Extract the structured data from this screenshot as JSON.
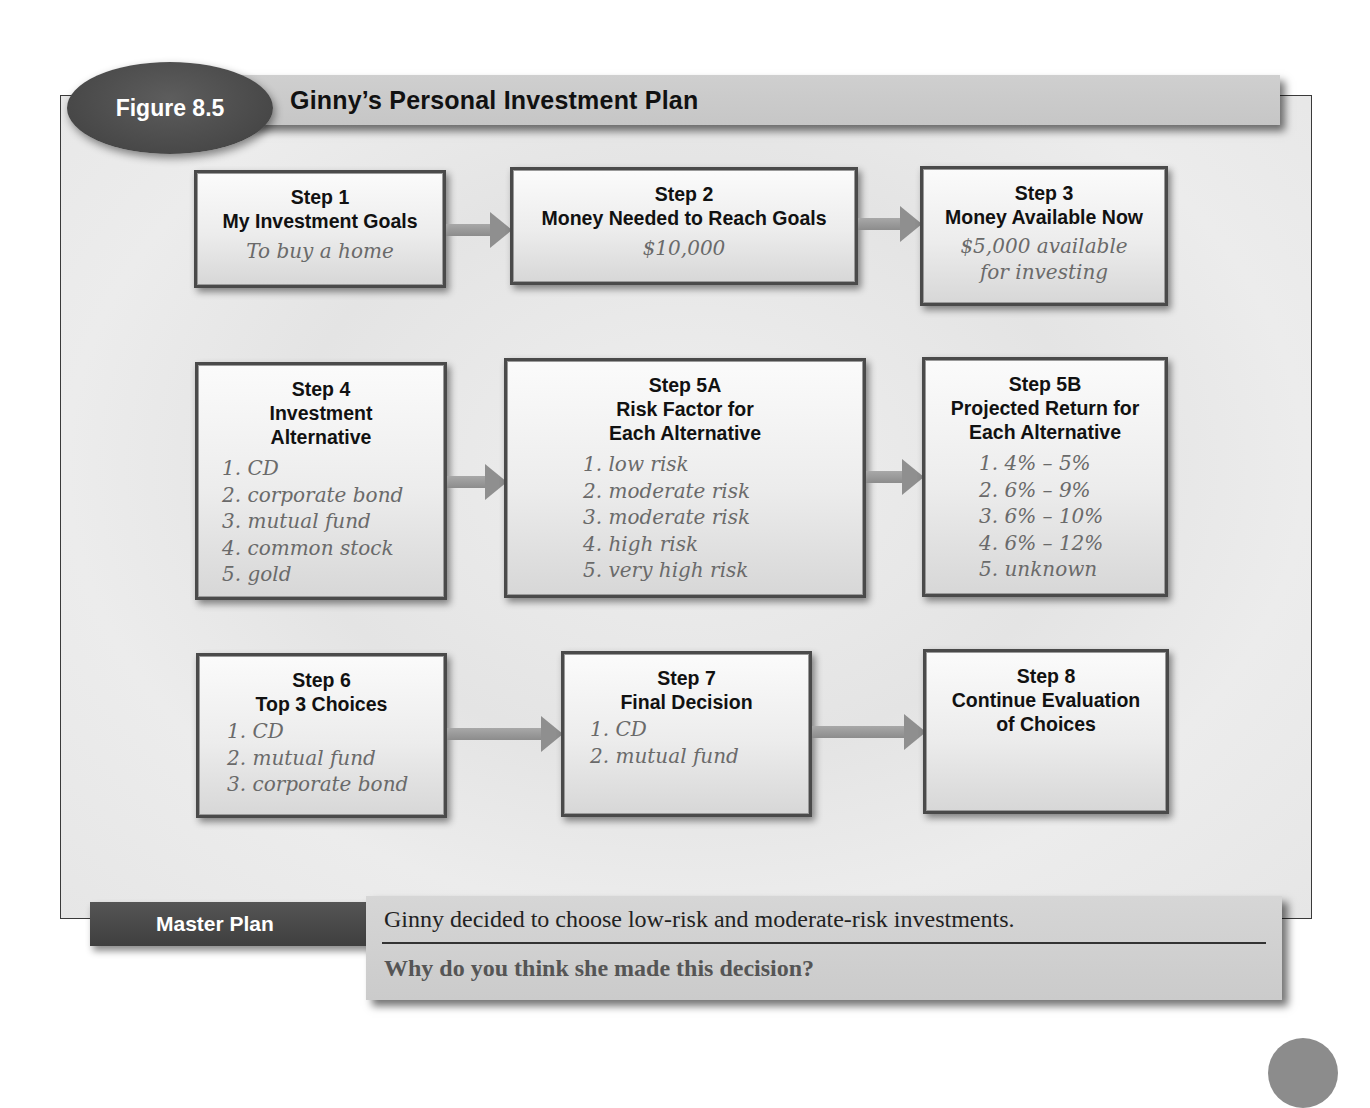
{
  "figure": {
    "label": "Figure 8.5",
    "title": "Ginny’s Personal Investment Plan"
  },
  "steps": {
    "s1": {
      "step": "Step 1",
      "heading": "My Investment Goals",
      "note": "To buy a home"
    },
    "s2": {
      "step": "Step 2",
      "heading": "Money Needed to Reach Goals",
      "note": "$10,000"
    },
    "s3": {
      "step": "Step 3",
      "heading": "Money Available Now",
      "note_line1": "$5,000 available",
      "note_line2": "for investing"
    },
    "s4": {
      "step": "Step 4",
      "heading_line1": "Investment",
      "heading_line2": "Alternative",
      "items": [
        "1. CD",
        "2. corporate bond",
        "3. mutual fund",
        "4. common stock",
        "5. gold"
      ]
    },
    "s5a": {
      "step": "Step 5A",
      "heading_line1": "Risk Factor for",
      "heading_line2": "Each Alternative",
      "items": [
        "1. low risk",
        "2. moderate risk",
        "3. moderate risk",
        "4. high risk",
        "5. very high risk"
      ]
    },
    "s5b": {
      "step": "Step 5B",
      "heading_line1": "Projected Return for",
      "heading_line2": "Each Alternative",
      "items": [
        "1. 4% – 5%",
        "2. 6% – 9%",
        "3. 6% – 10%",
        "4. 6% – 12%",
        "5. unknown"
      ]
    },
    "s6": {
      "step": "Step 6",
      "heading": "Top 3 Choices",
      "items": [
        "1. CD",
        "2. mutual fund",
        "3. corporate bond"
      ]
    },
    "s7": {
      "step": "Step 7",
      "heading": "Final Decision",
      "items": [
        "1. CD",
        "2. mutual fund"
      ]
    },
    "s8": {
      "step": "Step 8",
      "heading_line1": "Continue Evaluation",
      "heading_line2": "of Choices"
    }
  },
  "master_plan": {
    "label": "Master Plan",
    "statement": "Ginny decided to choose low-risk and moderate-risk investments.",
    "question": "Why do you think she made this decision?"
  },
  "colors": {
    "badge": "#4a4a4a",
    "title_bar": "#c9c9c9",
    "handwriting": "#6a6a6a",
    "arrow": "#8f8f8f"
  }
}
